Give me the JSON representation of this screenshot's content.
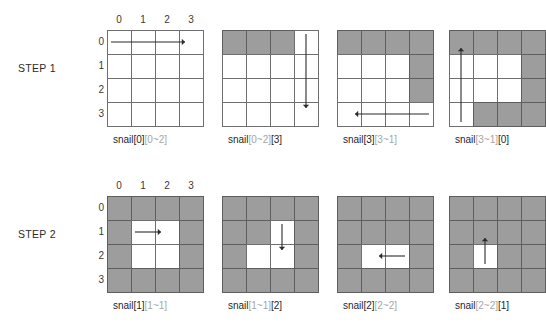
{
  "figure": {
    "title_present": false,
    "colors": {
      "filled_cell": "#9d9d9d",
      "empty_cell": "#ffffff",
      "grid_line": "#6f6f6f",
      "caption_primary": "#1f1f1f",
      "caption_dim": "#a6a6a6",
      "arrow": "#2b2b2b",
      "background": "#ffffff"
    },
    "grid_size": 4,
    "column_headers": [
      "0",
      "1",
      "2",
      "3"
    ],
    "row_headers": [
      "0",
      "1",
      "2",
      "3"
    ]
  },
  "steps": [
    {
      "label": "STEP 1",
      "panels": [
        {
          "caption_parts": [
            {
              "text": "snail[0]",
              "dim": false
            },
            {
              "text": "[0~2]",
              "dim": true
            }
          ],
          "caption_plain": "snail[0][0~2]",
          "filled": [],
          "arrow": {
            "direction": "right",
            "from_row": 0,
            "from_col": 0,
            "to_row": 0,
            "to_col": 3
          }
        },
        {
          "caption_parts": [
            {
              "text": "snail",
              "dim": false
            },
            {
              "text": "[0~2]",
              "dim": true
            },
            {
              "text": "[3]",
              "dim": false
            }
          ],
          "caption_plain": "snail[0~2][3]",
          "filled": [
            [
              0,
              0
            ],
            [
              0,
              1
            ],
            [
              0,
              2
            ]
          ],
          "arrow": {
            "direction": "down",
            "from_row": 0,
            "from_col": 3,
            "to_row": 3,
            "to_col": 3
          }
        },
        {
          "caption_parts": [
            {
              "text": "snail[3]",
              "dim": false
            },
            {
              "text": "[3~1]",
              "dim": true
            }
          ],
          "caption_plain": "snail[3][3~1]",
          "filled": [
            [
              0,
              0
            ],
            [
              0,
              1
            ],
            [
              0,
              2
            ],
            [
              0,
              3
            ],
            [
              1,
              3
            ],
            [
              2,
              3
            ]
          ],
          "arrow": {
            "direction": "left",
            "from_row": 3,
            "from_col": 3,
            "to_row": 3,
            "to_col": 0
          }
        },
        {
          "caption_parts": [
            {
              "text": "snail",
              "dim": false
            },
            {
              "text": "[3~1]",
              "dim": true
            },
            {
              "text": "[0]",
              "dim": false
            }
          ],
          "caption_plain": "snail[3~1][0]",
          "filled": [
            [
              0,
              0
            ],
            [
              0,
              1
            ],
            [
              0,
              2
            ],
            [
              0,
              3
            ],
            [
              1,
              3
            ],
            [
              2,
              3
            ],
            [
              3,
              3
            ],
            [
              3,
              2
            ],
            [
              3,
              1
            ]
          ],
          "arrow": {
            "direction": "up",
            "from_row": 3,
            "from_col": 0,
            "to_row": 0,
            "to_col": 0
          }
        }
      ]
    },
    {
      "label": "STEP 2",
      "panels": [
        {
          "caption_parts": [
            {
              "text": "snail[1]",
              "dim": false
            },
            {
              "text": "[1~1]",
              "dim": true
            }
          ],
          "caption_plain": "snail[1][1~1]",
          "filled": [
            [
              0,
              0
            ],
            [
              0,
              1
            ],
            [
              0,
              2
            ],
            [
              0,
              3
            ],
            [
              1,
              0
            ],
            [
              1,
              3
            ],
            [
              2,
              0
            ],
            [
              2,
              3
            ],
            [
              3,
              0
            ],
            [
              3,
              1
            ],
            [
              3,
              2
            ],
            [
              3,
              3
            ]
          ],
          "arrow": {
            "direction": "right",
            "from_row": 1,
            "from_col": 1,
            "to_row": 1,
            "to_col": 2
          }
        },
        {
          "caption_parts": [
            {
              "text": "snail",
              "dim": false
            },
            {
              "text": "[1~1]",
              "dim": true
            },
            {
              "text": "[2]",
              "dim": false
            }
          ],
          "caption_plain": "snail[1~1][2]",
          "filled": [
            [
              0,
              0
            ],
            [
              0,
              1
            ],
            [
              0,
              2
            ],
            [
              0,
              3
            ],
            [
              1,
              0
            ],
            [
              1,
              1
            ],
            [
              1,
              3
            ],
            [
              2,
              0
            ],
            [
              2,
              3
            ],
            [
              3,
              0
            ],
            [
              3,
              1
            ],
            [
              3,
              2
            ],
            [
              3,
              3
            ]
          ],
          "arrow": {
            "direction": "down",
            "from_row": 1,
            "from_col": 2,
            "to_row": 2,
            "to_col": 2
          }
        },
        {
          "caption_parts": [
            {
              "text": "snail[2]",
              "dim": false
            },
            {
              "text": "[2~2]",
              "dim": true
            }
          ],
          "caption_plain": "snail[2][2~2]",
          "filled": [
            [
              0,
              0
            ],
            [
              0,
              1
            ],
            [
              0,
              2
            ],
            [
              0,
              3
            ],
            [
              1,
              0
            ],
            [
              1,
              1
            ],
            [
              1,
              2
            ],
            [
              1,
              3
            ],
            [
              2,
              0
            ],
            [
              2,
              3
            ],
            [
              3,
              0
            ],
            [
              3,
              1
            ],
            [
              3,
              2
            ],
            [
              3,
              3
            ]
          ],
          "arrow": {
            "direction": "left",
            "from_row": 2,
            "from_col": 2,
            "to_row": 2,
            "to_col": 1
          }
        },
        {
          "caption_parts": [
            {
              "text": "snail",
              "dim": false
            },
            {
              "text": "[2~2]",
              "dim": true
            },
            {
              "text": "[1]",
              "dim": false
            }
          ],
          "caption_plain": "snail[2~2][1]",
          "filled": [
            [
              0,
              0
            ],
            [
              0,
              1
            ],
            [
              0,
              2
            ],
            [
              0,
              3
            ],
            [
              1,
              0
            ],
            [
              1,
              1
            ],
            [
              1,
              2
            ],
            [
              1,
              3
            ],
            [
              2,
              0
            ],
            [
              2,
              2
            ],
            [
              2,
              3
            ],
            [
              3,
              0
            ],
            [
              3,
              1
            ],
            [
              3,
              2
            ],
            [
              3,
              3
            ]
          ],
          "arrow": {
            "direction": "up",
            "from_row": 2,
            "from_col": 1,
            "to_row": 1,
            "to_col": 1
          }
        }
      ]
    }
  ]
}
